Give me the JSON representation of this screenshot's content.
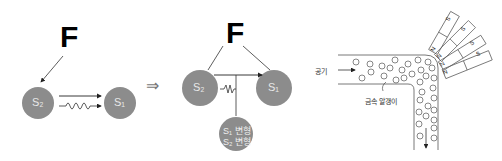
{
  "panel1": {
    "force_label": "F",
    "left_substance": "S₂",
    "right_substance": "S₁"
  },
  "implies_symbol": "⇒",
  "panel2": {
    "force_label": "F",
    "left_substance": "S₂",
    "right_substance": "S₁",
    "bottom_line1": "S₁ 변형",
    "bottom_line2": "S₂ 변형"
  },
  "panel3": {
    "air_label": "공기",
    "particles_label": "금속 알갱이",
    "magnets": [
      {
        "north": "N",
        "south": "S"
      },
      {
        "north": "N",
        "south": "S"
      },
      {
        "north": "N",
        "south": "S"
      },
      {
        "north": "N",
        "south": "S"
      }
    ]
  },
  "colors": {
    "circle_fill": "#8c8c8c",
    "line": "#333333"
  }
}
